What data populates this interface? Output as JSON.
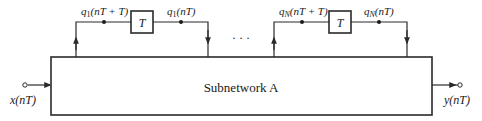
{
  "diagram": {
    "main_block": {
      "label": "Subnetwork A"
    },
    "input": {
      "label": "x(nT)"
    },
    "output": {
      "label": "y(nT)"
    },
    "ellipsis": "· · ·",
    "delay_loops": [
      {
        "delay_label": "T",
        "in_label_base": "q",
        "in_label_sub": "1",
        "in_label_arg": "(nT + T)",
        "out_label_base": "q",
        "out_label_sub": "1",
        "out_label_arg": "(nT)"
      },
      {
        "delay_label": "T",
        "in_label_base": "q",
        "in_label_sub": "N",
        "in_label_arg": "(nT + T)",
        "out_label_base": "q",
        "out_label_sub": "N",
        "out_label_arg": "(nT)"
      }
    ]
  }
}
